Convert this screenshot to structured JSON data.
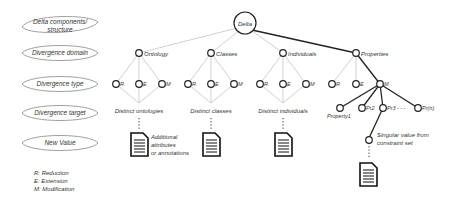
{
  "legend_rows": [
    {
      "label": "Delta components/\nstructure",
      "line1": "Delta components/",
      "line2": "structure"
    },
    {
      "label": "Divergence domain"
    },
    {
      "label": "Divergence type"
    },
    {
      "label": "Divergence target"
    },
    {
      "label": "New Value"
    }
  ],
  "key": {
    "r": "R: Reduction",
    "e": "E: Extension",
    "m": "M: Modification"
  },
  "root": {
    "label": "Delta"
  },
  "domains": [
    {
      "label": "Ontology",
      "types": [
        "R",
        "E",
        "M"
      ],
      "target": "Distinct ontologies",
      "annotation": [
        "Additional",
        "attributes",
        "or annotations"
      ]
    },
    {
      "label": "Classes",
      "types": [
        "R",
        "E",
        "M"
      ],
      "target": "Distinct classes"
    },
    {
      "label": "Individuals",
      "types": [
        "R",
        "E",
        "M"
      ],
      "target": "Distinct individuals"
    },
    {
      "label": "Properties",
      "types": [
        "R",
        "E",
        "M"
      ]
    }
  ],
  "properties_targets": [
    "Property1",
    "Pr2",
    "Pr3 - - -",
    "Pr(n)"
  ],
  "singular_value": [
    "Singular value from",
    "constraint set"
  ],
  "colors": {
    "thin_line": "#bbbbbb",
    "bold_line": "#222222",
    "node": "#222222"
  }
}
